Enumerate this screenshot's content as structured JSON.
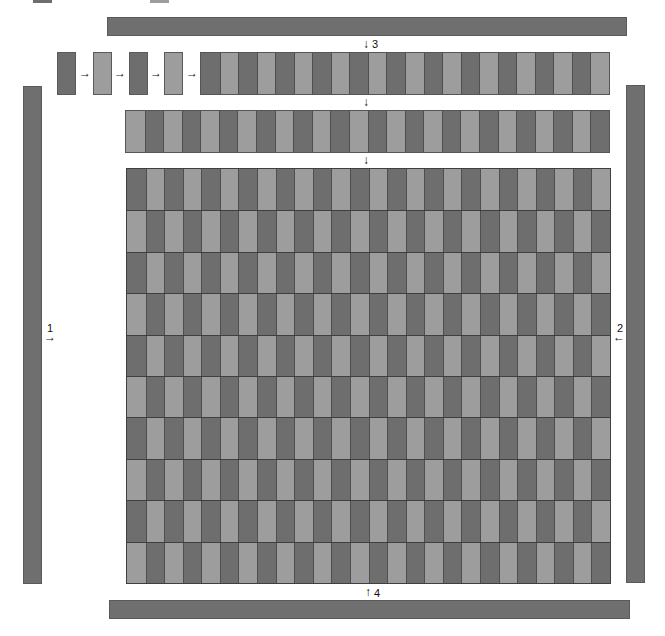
{
  "colors": {
    "dark": "#6e6e6e",
    "light": "#9d9d9d",
    "bar": "#6f6f6f"
  },
  "labels": {
    "l1": "1",
    "l2": "2",
    "l3": "3",
    "l4": "4"
  },
  "arrows": {
    "right": "→",
    "left": "←",
    "down": "↓",
    "up": "↑"
  },
  "sequence_boxes": [
    "dark",
    "light",
    "dark",
    "light"
  ],
  "strip_row_1": {
    "count": 22,
    "start": "dark"
  },
  "strip_row_2": {
    "count": 26,
    "start": "light"
  },
  "grid": {
    "rows": 10,
    "cols": 26,
    "first_row_start": "dark",
    "alternating": true
  }
}
